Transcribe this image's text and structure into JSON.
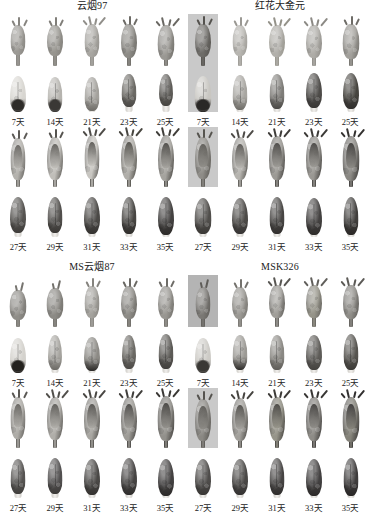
{
  "figure": {
    "background_color": "#ffffff",
    "panel_count": 4,
    "rows_per_panel": 4,
    "columns_per_row": 5
  },
  "panels": [
    {
      "id": "panel-yunyan97",
      "title": "云烟97",
      "position": "top-left",
      "rows": [
        {
          "type": "bud",
          "stage": "early",
          "labels_row": false
        },
        {
          "type": "organ",
          "stage": "early",
          "labels_row": true,
          "labels": [
            "7天",
            "14天",
            "21天",
            "23天",
            "25天"
          ]
        },
        {
          "type": "bud",
          "stage": "late",
          "labels_row": false
        },
        {
          "type": "organ",
          "stage": "late",
          "labels_row": true,
          "labels": [
            "27天",
            "29天",
            "31天",
            "33天",
            "35天"
          ]
        }
      ]
    },
    {
      "id": "panel-honghuadajinyuan",
      "title": "红花大金元",
      "position": "top-right",
      "rows": [
        {
          "type": "bud",
          "stage": "early",
          "labels_row": false
        },
        {
          "type": "organ",
          "stage": "early",
          "labels_row": true,
          "labels": [
            "7天",
            "14天",
            "21天",
            "23天",
            "25天"
          ]
        },
        {
          "type": "bud",
          "stage": "late",
          "labels_row": false
        },
        {
          "type": "organ",
          "stage": "late",
          "labels_row": true,
          "labels": [
            "27天",
            "29天",
            "31天",
            "33天",
            "35天"
          ]
        }
      ]
    },
    {
      "id": "panel-ms-yunyan87",
      "title": "MS云烟87",
      "position": "bottom-left",
      "rows": [
        {
          "type": "bud",
          "stage": "early",
          "labels_row": false
        },
        {
          "type": "organ",
          "stage": "early",
          "labels_row": true,
          "labels": [
            "7天",
            "14天",
            "21天",
            "23天",
            "25天"
          ]
        },
        {
          "type": "bud",
          "stage": "late",
          "labels_row": false
        },
        {
          "type": "organ",
          "stage": "late",
          "labels_row": true,
          "labels": [
            "27天",
            "29天",
            "31天",
            "33天",
            "35天"
          ]
        }
      ]
    },
    {
      "id": "panel-msk326",
      "title": "MSK326",
      "position": "bottom-right",
      "rows": [
        {
          "type": "bud",
          "stage": "early",
          "labels_row": false
        },
        {
          "type": "organ",
          "stage": "early",
          "labels_row": true,
          "labels": [
            "7天",
            "14天",
            "21天",
            "23天",
            "25天"
          ]
        },
        {
          "type": "bud",
          "stage": "late",
          "labels_row": false
        },
        {
          "type": "organ",
          "stage": "late",
          "labels_row": true,
          "labels": [
            "27天",
            "29天",
            "31天",
            "33天",
            "35天"
          ]
        }
      ]
    }
  ],
  "time_points": {
    "early_series": [
      "7天",
      "14天",
      "21天",
      "23天",
      "25天"
    ],
    "late_series": [
      "27天",
      "29天",
      "31天",
      "33天",
      "35天"
    ]
  },
  "specimens": {
    "panel-yunyan97": {
      "bud_early": [
        {
          "plate": "white",
          "calyx": "#9c9a95",
          "tone": "#86847f",
          "h": 30,
          "w": 15,
          "sepals": 3,
          "stalk": 14
        },
        {
          "plate": "white",
          "calyx": "#97958f",
          "tone": "#807e79",
          "h": 31,
          "w": 16,
          "sepals": 3,
          "stalk": 13
        },
        {
          "plate": "white",
          "calyx": "#a8a6a1",
          "tone": "#918f8a",
          "h": 33,
          "w": 15,
          "sepals": 4,
          "stalk": 12
        },
        {
          "plate": "white",
          "calyx": "#8d8b86",
          "tone": "#6d6b66",
          "h": 34,
          "w": 16,
          "sepals": 3,
          "stalk": 11
        },
        {
          "plate": "white",
          "calyx": "#9a9893",
          "tone": "#6a6863",
          "h": 35,
          "w": 17,
          "sepals": 4,
          "stalk": 9
        }
      ],
      "organ_early": [
        {
          "plate": "white",
          "body": "#d8d6d1",
          "band": "#2e2c29",
          "h": 36,
          "w": 16,
          "foot": 0
        },
        {
          "plate": "white",
          "body": "#b6b4af",
          "band": "#3a3835",
          "h": 35,
          "w": 15,
          "foot": 0
        },
        {
          "plate": "white",
          "body": "#a3a19c",
          "band": "#6e6c67",
          "h": 34,
          "w": 15,
          "foot": 4
        },
        {
          "plate": "white",
          "body": "#6b6964",
          "band": "#4a4845",
          "h": 33,
          "w": 15,
          "foot": 8
        },
        {
          "plate": "white",
          "body": "#5e5c58",
          "band": "#45433f",
          "h": 32,
          "w": 14,
          "foot": 9
        }
      ],
      "bud_late": [
        {
          "plate": "white",
          "calyx": "#b4b2ad",
          "tone": "#5c5a56",
          "h": 42,
          "w": 15,
          "sepals": 3,
          "stalk": 10
        },
        {
          "plate": "white",
          "calyx": "#c0beb9",
          "tone": "#55534f",
          "h": 43,
          "w": 16,
          "sepals": 3,
          "stalk": 10
        },
        {
          "plate": "white",
          "calyx": "#c8c6c1",
          "tone": "#4e4c48",
          "h": 44,
          "w": 15,
          "sepals": 4,
          "stalk": 11
        },
        {
          "plate": "white",
          "calyx": "#b0aea9",
          "tone": "#47453f",
          "h": 45,
          "w": 16,
          "sepals": 4,
          "stalk": 10
        },
        {
          "plate": "white",
          "calyx": "#a5a39e",
          "tone": "#403e3a",
          "h": 46,
          "w": 16,
          "sepals": 4,
          "stalk": 9
        }
      ],
      "organ_late": [
        {
          "plate": "white",
          "body": "#555350",
          "band": "#3e3c39",
          "h": 36,
          "w": 16,
          "foot": 7
        },
        {
          "plate": "white",
          "body": "#514f4c",
          "band": "#3a3835",
          "h": 36,
          "w": 15,
          "foot": 7
        },
        {
          "plate": "white",
          "body": "#4b4946",
          "band": "#343230",
          "h": 37,
          "w": 16,
          "foot": 6
        },
        {
          "plate": "white",
          "body": "#474542",
          "band": "#302e2c",
          "h": 37,
          "w": 15,
          "foot": 6
        },
        {
          "plate": "white",
          "body": "#434140",
          "band": "#2c2a28",
          "h": 38,
          "w": 16,
          "foot": 5
        }
      ]
    },
    "panel-honghuadajinyuan": {
      "bud_early": [
        {
          "plate": "gray",
          "calyx": "#6e6c68",
          "tone": "#54524e",
          "h": 33,
          "w": 16,
          "sepals": 3,
          "stalk": 12
        },
        {
          "plate": "white",
          "calyx": "#b8b6b1",
          "tone": "#9a9893",
          "h": 31,
          "w": 15,
          "sepals": 3,
          "stalk": 13
        },
        {
          "plate": "white",
          "calyx": "#b2b0ab",
          "tone": "#949289",
          "h": 32,
          "w": 16,
          "sepals": 4,
          "stalk": 12
        },
        {
          "plate": "white",
          "calyx": "#aeaca7",
          "tone": "#8c8a85",
          "h": 33,
          "w": 16,
          "sepals": 4,
          "stalk": 11
        },
        {
          "plate": "white",
          "calyx": "#a2a09b",
          "tone": "#6e6c67",
          "h": 35,
          "w": 17,
          "sepals": 3,
          "stalk": 10
        }
      ],
      "organ_early": [
        {
          "plate": "gray",
          "body": "#c8c6c1",
          "band": "#2a2826",
          "h": 36,
          "w": 17,
          "foot": 0
        },
        {
          "plate": "white",
          "body": "#a8a6a1",
          "band": "#6d6b66",
          "h": 35,
          "w": 15,
          "foot": 5
        },
        {
          "plate": "white",
          "body": "#7e7c78",
          "band": "#4a4845",
          "h": 35,
          "w": 15,
          "foot": 6
        },
        {
          "plate": "white",
          "body": "#4e4c49",
          "band": "#383634",
          "h": 35,
          "w": 16,
          "foot": 7
        },
        {
          "plate": "white",
          "body": "#46443f",
          "band": "#302e2c",
          "h": 36,
          "w": 16,
          "foot": 6
        }
      ],
      "bud_late": [
        {
          "plate": "gray",
          "calyx": "#8e8c87",
          "tone": "#56544f",
          "h": 42,
          "w": 16,
          "sepals": 3,
          "stalk": 11
        },
        {
          "plate": "white",
          "calyx": "#b6b4af",
          "tone": "#4e4c48",
          "h": 43,
          "w": 16,
          "sepals": 4,
          "stalk": 10
        },
        {
          "plate": "white",
          "calyx": "#9c9a95",
          "tone": "#3e3c39",
          "h": 44,
          "w": 16,
          "sepals": 4,
          "stalk": 10
        },
        {
          "plate": "white",
          "calyx": "#9a9893",
          "tone": "#3c3a37",
          "h": 44,
          "w": 16,
          "sepals": 4,
          "stalk": 10
        },
        {
          "plate": "white",
          "calyx": "#8a8883",
          "tone": "#343230",
          "h": 45,
          "w": 17,
          "sepals": 4,
          "stalk": 9
        }
      ],
      "organ_late": [
        {
          "plate": "white",
          "body": "#504e4b",
          "band": "#3a3835",
          "h": 36,
          "w": 17,
          "foot": 6
        },
        {
          "plate": "white",
          "body": "#4c4a47",
          "band": "#363433",
          "h": 36,
          "w": 16,
          "foot": 6
        },
        {
          "plate": "white",
          "body": "#474543",
          "band": "#322f2e",
          "h": 37,
          "w": 15,
          "foot": 6
        },
        {
          "plate": "white",
          "body": "#434140",
          "band": "#2e2c2a",
          "h": 37,
          "w": 16,
          "foot": 5
        },
        {
          "plate": "white",
          "body": "#403e3c",
          "band": "#2a2826",
          "h": 38,
          "w": 15,
          "foot": 5
        }
      ]
    },
    "panel-ms-yunyan87": {
      "bud_early": [
        {
          "plate": "white",
          "calyx": "#908e89",
          "tone": "#76746f",
          "h": 30,
          "w": 17,
          "sepals": 2,
          "stalk": 10
        },
        {
          "plate": "white",
          "calyx": "#8c8a85",
          "tone": "#72706b",
          "h": 31,
          "w": 17,
          "sepals": 2,
          "stalk": 11
        },
        {
          "plate": "white",
          "calyx": "#a4a29d",
          "tone": "#85837e",
          "h": 32,
          "w": 15,
          "sepals": 3,
          "stalk": 12
        },
        {
          "plate": "white",
          "calyx": "#8e8c87",
          "tone": "#6a6863",
          "h": 33,
          "w": 16,
          "sepals": 3,
          "stalk": 11
        },
        {
          "plate": "white",
          "calyx": "#989691",
          "tone": "#6e6c67",
          "h": 33,
          "w": 16,
          "sepals": 3,
          "stalk": 11
        }
      ],
      "organ_early": [
        {
          "plate": "white",
          "body": "#d4d2cd",
          "band": "#24221f",
          "h": 35,
          "w": 16,
          "foot": 0
        },
        {
          "plate": "white",
          "body": "#a6a49f",
          "band": "#6c6a65",
          "h": 35,
          "w": 14,
          "foot": 6
        },
        {
          "plate": "white",
          "body": "#8c8a85",
          "band": "#2a2826",
          "h": 34,
          "w": 16,
          "foot": 5
        },
        {
          "plate": "white",
          "body": "#6a6863",
          "band": "#4c4a47",
          "h": 34,
          "w": 14,
          "foot": 7
        },
        {
          "plate": "white",
          "body": "#5c5a56",
          "band": "#413f3c",
          "h": 35,
          "w": 15,
          "foot": 7
        }
      ],
      "bud_late": [
        {
          "plate": "white",
          "calyx": "#aeaca7",
          "tone": "#5a5854",
          "h": 42,
          "w": 15,
          "sepals": 3,
          "stalk": 12
        },
        {
          "plate": "white",
          "calyx": "#b0aea9",
          "tone": "#514f4b",
          "h": 43,
          "w": 16,
          "sepals": 4,
          "stalk": 11
        },
        {
          "plate": "white",
          "calyx": "#a8a6a1",
          "tone": "#494743",
          "h": 43,
          "w": 16,
          "sepals": 4,
          "stalk": 11
        },
        {
          "plate": "white",
          "calyx": "#9e9c97",
          "tone": "#403e3b",
          "h": 44,
          "w": 16,
          "sepals": 4,
          "stalk": 10
        },
        {
          "plate": "white",
          "calyx": "#92908b",
          "tone": "#3a3835",
          "h": 45,
          "w": 17,
          "sepals": 4,
          "stalk": 10
        }
      ],
      "organ_late": [
        {
          "plate": "white",
          "body": "#565452",
          "band": "#403e3c",
          "h": 35,
          "w": 15,
          "foot": 7
        },
        {
          "plate": "white",
          "body": "#525050",
          "band": "#3c3a38",
          "h": 36,
          "w": 15,
          "foot": 7
        },
        {
          "plate": "white",
          "body": "#4a4846",
          "band": "#343230",
          "h": 36,
          "w": 16,
          "foot": 6
        },
        {
          "plate": "white",
          "body": "#464443",
          "band": "#302e2d",
          "h": 37,
          "w": 16,
          "foot": 6
        },
        {
          "plate": "white",
          "body": "#424040",
          "band": "#2c2a29",
          "h": 37,
          "w": 16,
          "foot": 5
        }
      ]
    },
    "panel-msk326": {
      "bud_early": [
        {
          "plate": "dkgray",
          "calyx": "#7a7874",
          "tone": "#5e5c58",
          "h": 32,
          "w": 15,
          "sepals": 2,
          "stalk": 11
        },
        {
          "plate": "white",
          "calyx": "#9a9893",
          "tone": "#74726d",
          "h": 32,
          "w": 16,
          "sepals": 3,
          "stalk": 11
        },
        {
          "plate": "white",
          "calyx": "#a09e99",
          "tone": "#585652",
          "h": 33,
          "w": 16,
          "sepals": 4,
          "stalk": 12
        },
        {
          "plate": "white",
          "calyx": "#969489",
          "tone": "#615f5b",
          "h": 33,
          "w": 16,
          "sepals": 4,
          "stalk": 12
        },
        {
          "plate": "white",
          "calyx": "#8e8c87",
          "tone": "#5c5a56",
          "h": 34,
          "w": 16,
          "sepals": 4,
          "stalk": 11
        }
      ],
      "organ_early": [
        {
          "plate": "white",
          "body": "#cdcbc6",
          "band": "#3a3835",
          "h": 35,
          "w": 16,
          "foot": 0
        },
        {
          "plate": "white",
          "body": "#9c9a95",
          "band": "#2e2c2a",
          "h": 35,
          "w": 15,
          "foot": 6
        },
        {
          "plate": "white",
          "body": "#8a8883",
          "band": "#5e5c58",
          "h": 35,
          "w": 15,
          "foot": 6
        },
        {
          "plate": "white",
          "body": "#5e5c58",
          "band": "#44423f",
          "h": 35,
          "w": 16,
          "foot": 6
        },
        {
          "plate": "white",
          "body": "#56544f",
          "band": "#3c3a37",
          "h": 36,
          "w": 15,
          "foot": 6
        }
      ],
      "bud_late": [
        {
          "plate": "gray",
          "calyx": "#8a8883",
          "tone": "#55534f",
          "h": 42,
          "w": 16,
          "sepals": 3,
          "stalk": 10
        },
        {
          "plate": "white",
          "calyx": "#a2a09b",
          "tone": "#464440",
          "h": 43,
          "w": 16,
          "sepals": 4,
          "stalk": 10
        },
        {
          "plate": "white",
          "calyx": "#969489",
          "tone": "#3c3a37",
          "h": 44,
          "w": 16,
          "sepals": 4,
          "stalk": 10
        },
        {
          "plate": "white",
          "calyx": "#8e8c87",
          "tone": "#383634",
          "h": 44,
          "w": 16,
          "sepals": 4,
          "stalk": 10
        },
        {
          "plate": "white",
          "calyx": "#848279",
          "tone": "#323030",
          "h": 45,
          "w": 17,
          "sepals": 4,
          "stalk": 9
        }
      ],
      "organ_late": [
        {
          "plate": "white",
          "body": "#4e4c4a",
          "band": "#383634",
          "h": 36,
          "w": 16,
          "foot": 6
        },
        {
          "plate": "white",
          "body": "#4a4846",
          "band": "#343231",
          "h": 36,
          "w": 16,
          "foot": 6
        },
        {
          "plate": "white",
          "body": "#464443",
          "band": "#302e2d",
          "h": 37,
          "w": 15,
          "foot": 6
        },
        {
          "plate": "white",
          "body": "#424040",
          "band": "#2c2a29",
          "h": 37,
          "w": 16,
          "foot": 5
        },
        {
          "plate": "white",
          "body": "#3e3c3c",
          "band": "#282626",
          "h": 38,
          "w": 15,
          "foot": 5
        }
      ]
    }
  }
}
